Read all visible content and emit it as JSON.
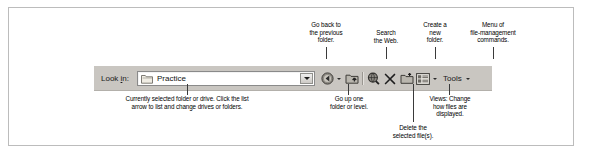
{
  "figure": {
    "type": "annotated-screenshot"
  },
  "toolbar": {
    "lookin_label_pre": "Look ",
    "lookin_label_accel": "i",
    "lookin_label_post": "n:",
    "lookin_label_full": "Look in:",
    "combo": {
      "value": "Practice",
      "icon": "folder-icon",
      "arrow": "chevron-down-icon"
    },
    "buttons": [
      {
        "name": "back-button",
        "icon": "back-arrow-icon",
        "label": ""
      },
      {
        "name": "back-dropdown",
        "icon": "chevron-down-icon",
        "label": ""
      },
      {
        "name": "up-one-level-button",
        "icon": "folder-up-icon",
        "label": ""
      },
      {
        "name": "search-web-button",
        "icon": "search-globe-icon",
        "label": ""
      },
      {
        "name": "delete-button",
        "icon": "close-x-icon",
        "label": ""
      },
      {
        "name": "new-folder-button",
        "icon": "new-folder-icon",
        "label": ""
      },
      {
        "name": "views-button",
        "icon": "views-list-icon",
        "label": ""
      },
      {
        "name": "views-dropdown",
        "icon": "chevron-down-icon",
        "label": ""
      },
      {
        "name": "tools-menu-button",
        "icon": "chevron-down-icon",
        "label": "Tools"
      }
    ],
    "tools_label": "Tools"
  },
  "callouts": {
    "go_back": "Go back to\nthe previous\nfolder.",
    "search_web": "Search\nthe Web.",
    "create_folder": "Create a\nnew\nfolder.",
    "menu_commands": "Menu of\nfile-management\ncommands.",
    "current_folder": "Currently selected folder or drive. Click the list\narrow to list and change drives or folders.",
    "go_up": "Go up one\nfolder or level.",
    "views": "Views: Change\nhow files are\ndisplayed.",
    "delete": "Delete the\nselected file(s)."
  },
  "colors": {
    "toolbar_bg": "#c9c6c1",
    "frame_border": "#bcbcbc",
    "leader_line": "#3a3a3a",
    "text": "#000000",
    "combo_bg": "#ffffff"
  }
}
